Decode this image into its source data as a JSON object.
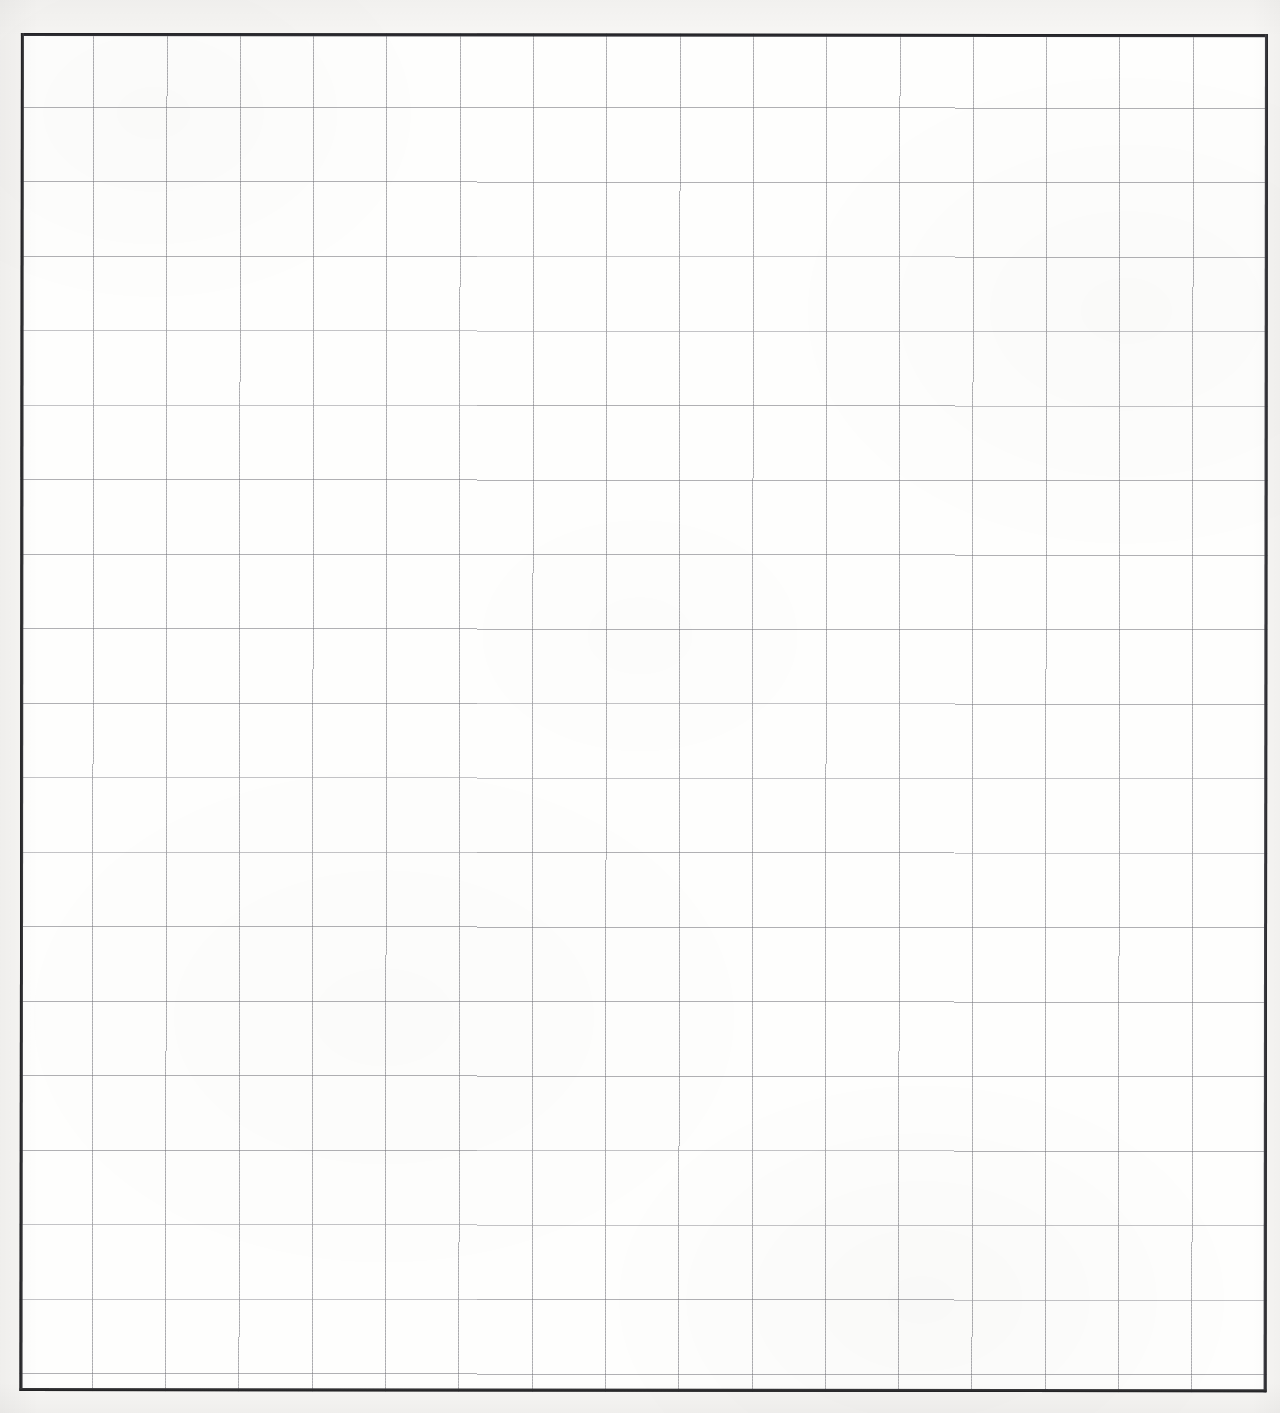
{
  "document": {
    "kind": "scanned-grid-paper",
    "title": "Blank grid paper scan",
    "description": "A scanned blank sheet of squared graph paper with a heavy ruled outer border and a light grey interior grid. No handwriting, text, labels or marks are present."
  },
  "canvas": {
    "width_px": 1280,
    "height_px": 1413,
    "paper_color": "#f7f6f4",
    "field_color": "#fefefd"
  },
  "grid_block": {
    "left_px": 21,
    "top_px": 33,
    "right_px": 1268,
    "bottom_px": 1391,
    "width_px": 1247,
    "height_px": 1358,
    "border_color": "#2b2b2d",
    "border_width_px": 2.4
  },
  "grid": {
    "line_color": "#787880",
    "line_width_px": 1,
    "columns": 17,
    "rows": 18,
    "cell_width_px": 73.3,
    "cell_height_px": 74.5,
    "vertical_line_x_px": [
      94,
      167,
      240,
      313,
      386,
      459,
      532,
      605,
      678,
      751,
      824,
      897,
      970,
      1043,
      1116,
      1189
    ],
    "horizontal_line_y_px": [
      107,
      181,
      255,
      329,
      403,
      477,
      551,
      625,
      699,
      773,
      847,
      921,
      995,
      1069,
      1143,
      1217,
      1291,
      1365
    ]
  },
  "margins": {
    "left_px": 21,
    "top_px": 33,
    "right_px": 12,
    "bottom_px": 22
  },
  "content": {
    "marks": [],
    "text": [],
    "annotations": []
  }
}
